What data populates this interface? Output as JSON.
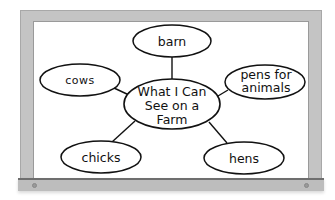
{
  "diagram": {
    "type": "web",
    "center": {
      "lines": [
        "What I Can",
        "See on a",
        "Farm"
      ]
    },
    "nodes": [
      {
        "id": "barn",
        "label": "barn"
      },
      {
        "id": "cows",
        "label": "cows"
      },
      {
        "id": "pens",
        "lines": [
          "pens for",
          "animals"
        ]
      },
      {
        "id": "chicks",
        "label": "chicks"
      },
      {
        "id": "hens",
        "label": "hens"
      }
    ]
  }
}
